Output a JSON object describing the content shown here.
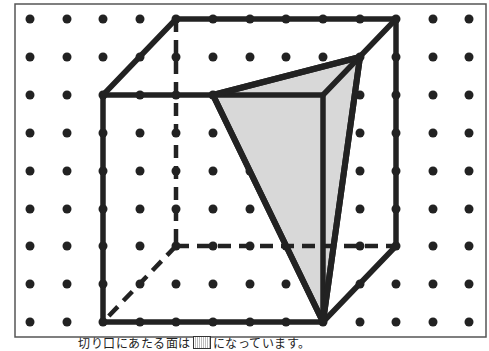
{
  "figure": {
    "type": "dot-grid cube cross-section",
    "grid": {
      "columns_x": [
        30,
        67,
        103,
        140,
        176,
        213,
        250,
        286,
        323,
        360,
        396,
        433,
        469
      ],
      "rows_y": [
        19,
        57,
        95,
        133,
        171,
        209,
        246,
        284,
        322
      ],
      "dot_color": "#222222"
    },
    "frame": {
      "x": 15,
      "y": 4,
      "width": 471,
      "height": 333
    },
    "cube": {
      "front_face": [
        [
          103,
          95
        ],
        [
          323,
          95
        ],
        [
          323,
          322
        ],
        [
          103,
          322
        ]
      ],
      "back_face": [
        [
          176,
          19
        ],
        [
          396,
          19
        ],
        [
          396,
          246
        ],
        [
          176,
          246
        ]
      ],
      "visible_edges": [
        [
          [
            103,
            95
          ],
          [
            176,
            19
          ]
        ],
        [
          [
            176,
            19
          ],
          [
            396,
            19
          ]
        ],
        [
          [
            323,
            95
          ],
          [
            396,
            19
          ]
        ],
        [
          [
            396,
            19
          ],
          [
            396,
            246
          ]
        ],
        [
          [
            396,
            246
          ],
          [
            323,
            322
          ]
        ]
      ],
      "hidden_edges": [
        [
          [
            176,
            19
          ],
          [
            176,
            246
          ]
        ],
        [
          [
            176,
            246
          ],
          [
            396,
            246
          ]
        ],
        [
          [
            176,
            246
          ],
          [
            103,
            322
          ]
        ]
      ],
      "edge_color": "#222222"
    },
    "cross_section": {
      "vertices": [
        [
          213,
          95
        ],
        [
          360,
          57
        ],
        [
          323,
          322
        ]
      ],
      "fill": "#d8d8d8",
      "stroke": "#222222"
    }
  },
  "caption": {
    "before_blank": "切り口にあたる面は",
    "after_blank": "になっています。"
  }
}
